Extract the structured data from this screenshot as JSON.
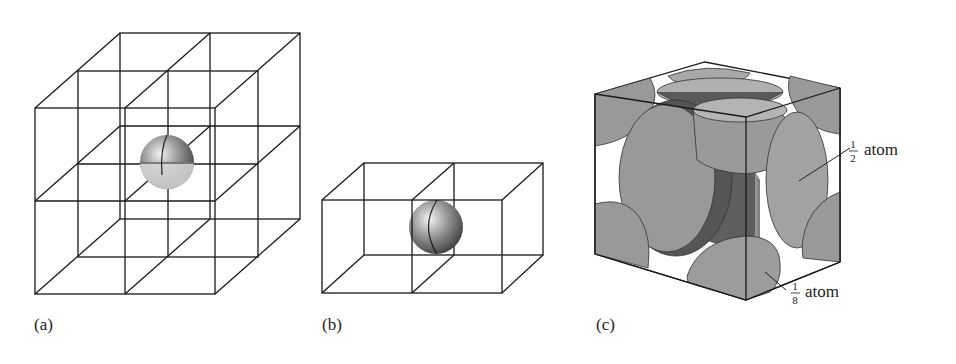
{
  "figure": {
    "panels": [
      {
        "id": "a",
        "label": "(a)",
        "description": "2x2x2 array of cubic unit cells with one atom shared at the central corner",
        "atom_fraction_visible": "1/8 of atom per cell"
      },
      {
        "id": "b",
        "label": "(b)",
        "description": "Two adjacent unit cells sharing a face with an atom at the face center"
      },
      {
        "id": "c",
        "label": "(c)",
        "description": "Face-centered cubic unit cell showing corner and face atoms",
        "annotations": [
          {
            "numerator": "1",
            "denominator": "2",
            "text": "atom"
          },
          {
            "numerator": "1",
            "denominator": "8",
            "text": "atom"
          }
        ]
      }
    ]
  },
  "colors": {
    "line": "#1a1a1a",
    "atom_face": "#a6a6a6",
    "atom_dark": "#6e6e6e",
    "atom_light": "#d9d9d9",
    "background": "#ffffff"
  }
}
